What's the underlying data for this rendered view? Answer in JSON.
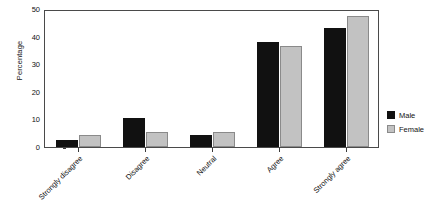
{
  "chart_data": {
    "type": "bar",
    "title": "",
    "xlabel": "",
    "ylabel": "Percentage",
    "ylim": [
      0,
      50
    ],
    "yticks": [
      0,
      10,
      20,
      30,
      40,
      50
    ],
    "ytick_labels": [
      "0",
      "10",
      "20",
      "30",
      "40",
      "50"
    ],
    "grid": false,
    "legend_position": "right",
    "categories": [
      "Strongly disagree",
      "Disagree",
      "Neutral",
      "Agree",
      "Strongly agree"
    ],
    "series": [
      {
        "name": "Male",
        "color": "#111111",
        "values": [
          2.5,
          10.5,
          4.5,
          38.0,
          43.0
        ]
      },
      {
        "name": "Female",
        "color": "#c2c2c2",
        "values": [
          4.2,
          5.4,
          5.6,
          36.7,
          47.4
        ]
      }
    ]
  },
  "legend": {
    "items": [
      {
        "label": "Male"
      },
      {
        "label": "Female"
      }
    ]
  }
}
